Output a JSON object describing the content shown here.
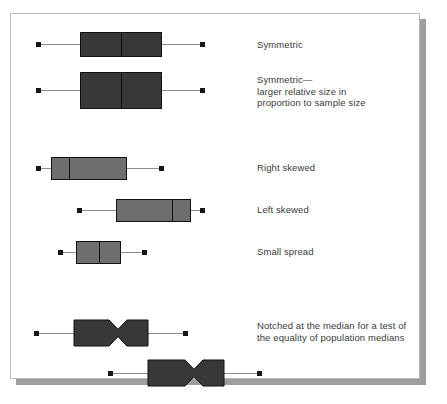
{
  "figure": {
    "kind": "boxplot-shapes-reference-figure",
    "background_color": "#ffffff",
    "frame_border_color": "#b9b9b9",
    "shadow_color": "#9d9d9d",
    "dark_fill": "#383838",
    "light_fill": "#6e6e6e",
    "outline_color": "#111111",
    "whisker_color": "#8d8d8d",
    "cap_color": "#161616",
    "text_color": "#3a3a3a"
  },
  "labels": {
    "symmetric": "Symmetric",
    "symmetric_large": "Symmetric—\nlarger relative size in\nproportion to sample size",
    "right_skewed": "Right skewed",
    "left_skewed": "Left skewed",
    "small_spread": "Small spread",
    "notched": "Notched at the median for a test of\nthe equality of population medians"
  },
  "chart_data": {
    "type": "boxplot-diagram",
    "title": "",
    "xlabel": "",
    "ylabel": "",
    "grid": false,
    "legend": "right-side text annotations",
    "axis_units": "pixels (schematic, no numeric axis shown)",
    "boxes": [
      {
        "name": "symmetric",
        "label": "Symmetric",
        "fill": "dark",
        "notched": false,
        "min": 38,
        "q1": 80,
        "median": 121,
        "q3": 162,
        "max": 202,
        "center_y": 44,
        "box_height": 25
      },
      {
        "name": "symmetric-large",
        "label": "Symmetric— larger relative size in proportion to sample size",
        "fill": "dark",
        "notched": false,
        "min": 38,
        "q1": 80,
        "median": 121,
        "q3": 162,
        "max": 202,
        "center_y": 90,
        "box_height": 37
      },
      {
        "name": "right-skewed",
        "label": "Right skewed",
        "fill": "light",
        "notched": false,
        "min": 38,
        "q1": 51,
        "median": 69,
        "q3": 127,
        "max": 161,
        "center_y": 168,
        "box_height": 23
      },
      {
        "name": "left-skewed",
        "label": "Left skewed",
        "fill": "light",
        "notched": false,
        "min": 79,
        "q1": 116,
        "median": 172,
        "q3": 191,
        "max": 202,
        "center_y": 210,
        "box_height": 23
      },
      {
        "name": "small-spread",
        "label": "Small spread",
        "fill": "light",
        "notched": false,
        "min": 60,
        "q1": 76,
        "median": 99,
        "q3": 121,
        "max": 144,
        "center_y": 252,
        "box_height": 23
      },
      {
        "name": "notched-upper",
        "label": "Notched at the median for a test of the equality of population medians",
        "fill": "dark",
        "notched": true,
        "min": 36,
        "q1": 74,
        "median": 118,
        "q3": 148,
        "max": 185,
        "center_y": 333,
        "box_height": 26,
        "notch_half_width": 9,
        "notch_depth_ratio": 0.36
      },
      {
        "name": "notched-lower",
        "label": "",
        "fill": "dark",
        "notched": true,
        "min": 110,
        "q1": 148,
        "median": 194,
        "q3": 224,
        "max": 259,
        "center_y": 373,
        "box_height": 26,
        "notch_half_width": 9,
        "notch_depth_ratio": 0.36
      }
    ],
    "annotations": [
      {
        "text": "Symmetric",
        "x": 257,
        "y": 39
      },
      {
        "text": "Symmetric—\nlarger relative size in\nproportion to sample size",
        "x": 257,
        "y": 74
      },
      {
        "text": "Right skewed",
        "x": 257,
        "y": 162
      },
      {
        "text": "Left skewed",
        "x": 257,
        "y": 204
      },
      {
        "text": "Small spread",
        "x": 257,
        "y": 246
      },
      {
        "text": "Notched at the median for a test of\nthe equality of population medians",
        "x": 257,
        "y": 320
      }
    ]
  }
}
